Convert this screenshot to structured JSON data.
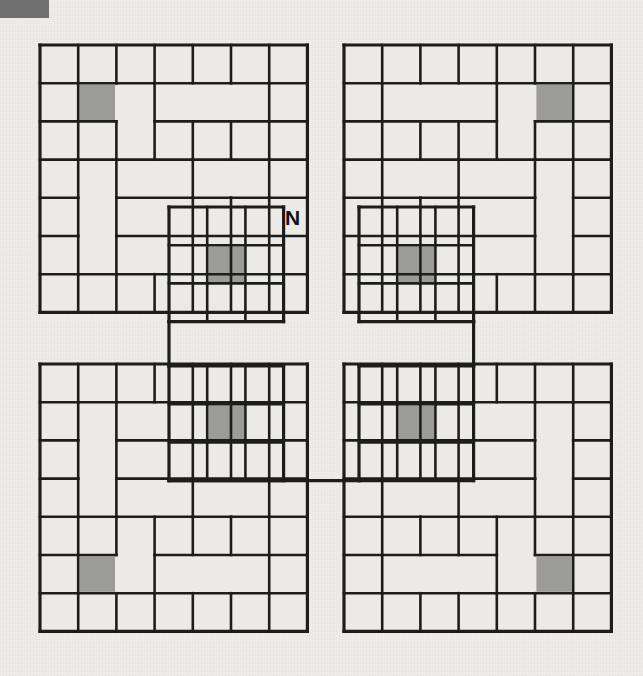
{
  "figure": {
    "kind": "maze-diagram",
    "background_color": "#efeeec",
    "wall_color": "#1d1d1d",
    "cell_fill_color": "#eceae7",
    "shaded_cell_color": "#9b9b99",
    "corner_mark_color": "#6f6f6f"
  },
  "corner_mark": {
    "name": "page-corner-mark",
    "x": 0,
    "y": 0,
    "width": 49,
    "height": 18
  },
  "labels": [
    {
      "text": "N",
      "x": 285,
      "y": 207,
      "name": "north-label"
    }
  ],
  "geometry": {
    "cell": 38.2,
    "quadrants": [
      {
        "name": "top-left",
        "origin_x": 40,
        "origin_y": 45,
        "cols": 7,
        "rows": 7
      },
      {
        "name": "top-right",
        "origin_x": 344,
        "origin_y": 45,
        "cols": 7,
        "rows": 7
      },
      {
        "name": "bottom-left",
        "origin_x": 40,
        "origin_y": 364,
        "cols": 7,
        "rows": 7
      },
      {
        "name": "bottom-right",
        "origin_x": 344,
        "origin_y": 364,
        "cols": 7,
        "rows": 7
      }
    ],
    "inner_blocks": [
      {
        "name": "inner-top-left",
        "origin_x": 169,
        "origin_y": 207,
        "cols": 3,
        "rows": 3
      },
      {
        "name": "inner-top-right",
        "origin_x": 359,
        "origin_y": 207,
        "cols": 3,
        "rows": 3
      },
      {
        "name": "inner-bottom-left",
        "origin_x": 169,
        "origin_y": 366,
        "cols": 3,
        "rows": 3
      },
      {
        "name": "inner-bottom-right",
        "origin_x": 359,
        "origin_y": 366,
        "cols": 3,
        "rows": 3
      }
    ]
  },
  "shaded_cells": [
    {
      "quadrant": "top-left",
      "col": 1,
      "row": 1
    },
    {
      "quadrant": "top-left",
      "col": 5,
      "row": 5
    },
    {
      "quadrant": "top-right",
      "col": 5,
      "row": 1
    },
    {
      "quadrant": "top-right",
      "col": 1,
      "row": 5
    },
    {
      "quadrant": "bottom-left",
      "col": 5,
      "row": 1
    },
    {
      "quadrant": "bottom-left",
      "col": 1,
      "row": 5
    },
    {
      "quadrant": "bottom-right",
      "col": 1,
      "row": 1
    },
    {
      "quadrant": "bottom-right",
      "col": 5,
      "row": 5
    }
  ],
  "chart_data": {
    "type": "table",
    "title": "",
    "quadrant_count": 4,
    "quadrant_grid": "7 x 7",
    "inner_grid": "3 x 3",
    "shaded_cell_count": 8,
    "labels": [
      "N"
    ]
  }
}
